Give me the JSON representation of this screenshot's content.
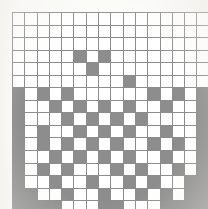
{
  "image": {
    "title": "Grid pattern",
    "kind": "binary-grid",
    "width": 208,
    "height": 209,
    "background_color": "#fbfbf8"
  },
  "grid": {
    "rows": 16,
    "columns": 16,
    "cell_width": 11.3,
    "cell_height": 11.55,
    "origin_x": 12,
    "origin_y": 12,
    "line_color": "#8c8c8c",
    "empty_color": "#ffffff",
    "filled_color": "#8d8d8d",
    "legend": {
      "filled_label": "filled cell",
      "empty_label": "empty cell"
    },
    "cells": [
      [
        0,
        0,
        0,
        0,
        0,
        0,
        0,
        0,
        0,
        0,
        0,
        0,
        0,
        0,
        0,
        0
      ],
      [
        0,
        0,
        0,
        0,
        0,
        0,
        0,
        0,
        0,
        0,
        0,
        0,
        0,
        0,
        0,
        0
      ],
      [
        0,
        0,
        0,
        0,
        0,
        0,
        0,
        0,
        0,
        0,
        0,
        0,
        0,
        0,
        0,
        0
      ],
      [
        0,
        0,
        0,
        0,
        0,
        1,
        0,
        1,
        0,
        0,
        0,
        0,
        0,
        0,
        0,
        0
      ],
      [
        0,
        0,
        0,
        0,
        0,
        0,
        1,
        0,
        0,
        0,
        0,
        0,
        0,
        0,
        0,
        0
      ],
      [
        0,
        0,
        0,
        0,
        0,
        0,
        0,
        0,
        0,
        1,
        0,
        0,
        0,
        0,
        0,
        0
      ],
      [
        1,
        0,
        1,
        0,
        1,
        0,
        0,
        0,
        0,
        0,
        0,
        1,
        0,
        1,
        0,
        1
      ],
      [
        1,
        0,
        0,
        1,
        0,
        1,
        0,
        1,
        0,
        1,
        0,
        0,
        1,
        0,
        0,
        1
      ],
      [
        1,
        0,
        0,
        0,
        1,
        0,
        1,
        0,
        1,
        0,
        1,
        0,
        0,
        0,
        0,
        1
      ],
      [
        1,
        0,
        1,
        0,
        0,
        1,
        0,
        1,
        0,
        1,
        0,
        0,
        1,
        0,
        0,
        1
      ],
      [
        1,
        0,
        1,
        0,
        1,
        0,
        1,
        0,
        1,
        0,
        0,
        1,
        0,
        1,
        0,
        1
      ],
      [
        1,
        0,
        0,
        1,
        0,
        1,
        0,
        1,
        0,
        1,
        0,
        0,
        1,
        0,
        0,
        1
      ],
      [
        1,
        0,
        1,
        0,
        1,
        0,
        0,
        0,
        1,
        0,
        1,
        0,
        0,
        1,
        0,
        1
      ],
      [
        1,
        0,
        0,
        1,
        0,
        0,
        1,
        0,
        0,
        1,
        0,
        1,
        0,
        0,
        1,
        1
      ],
      [
        1,
        1,
        0,
        0,
        1,
        0,
        0,
        1,
        0,
        0,
        1,
        0,
        1,
        0,
        1,
        1
      ],
      [
        1,
        1,
        1,
        1,
        0,
        0,
        0,
        1,
        1,
        0,
        0,
        0,
        1,
        1,
        1,
        1
      ]
    ]
  }
}
